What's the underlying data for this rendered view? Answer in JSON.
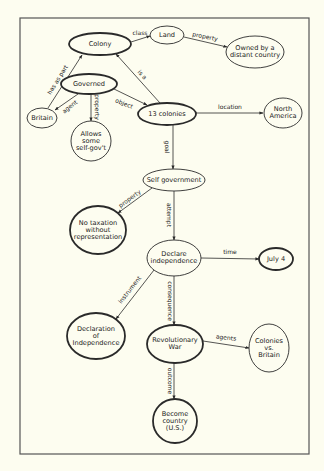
{
  "diagram": {
    "type": "concept-map",
    "frame": {
      "x": 20,
      "y": 18,
      "width": 289,
      "height": 436
    },
    "colors": {
      "background": "#fdfdf0",
      "ink": "#2a2a2a",
      "frame": "#555555"
    },
    "nodes": [
      {
        "id": "colony",
        "lines": [
          "Colony"
        ],
        "cx": 100,
        "cy": 44,
        "rx": 31,
        "ry": 11,
        "bold": true
      },
      {
        "id": "land",
        "lines": [
          "Land"
        ],
        "cx": 167,
        "cy": 35,
        "rx": 17,
        "ry": 9,
        "bold": false
      },
      {
        "id": "owned",
        "lines": [
          "Owned by a",
          "distant country"
        ],
        "cx": 255,
        "cy": 52,
        "rx": 29,
        "ry": 16,
        "bold": false
      },
      {
        "id": "governed",
        "lines": [
          "Governed"
        ],
        "cx": 89,
        "cy": 84,
        "rx": 28,
        "ry": 10,
        "bold": true
      },
      {
        "id": "britain",
        "lines": [
          "Britain"
        ],
        "cx": 42,
        "cy": 118,
        "rx": 15,
        "ry": 10,
        "bold": false
      },
      {
        "id": "allows",
        "lines": [
          "Allows",
          "some",
          "self-gov't"
        ],
        "cx": 91,
        "cy": 141,
        "rx": 20,
        "ry": 20,
        "bold": false
      },
      {
        "id": "thirteen",
        "lines": [
          "13 colonies"
        ],
        "cx": 167,
        "cy": 114,
        "rx": 29,
        "ry": 11,
        "bold": true
      },
      {
        "id": "northamerica",
        "lines": [
          "North",
          "America"
        ],
        "cx": 283,
        "cy": 113,
        "rx": 19,
        "ry": 15,
        "bold": false
      },
      {
        "id": "selfgov",
        "lines": [
          "Self government"
        ],
        "cx": 174,
        "cy": 180,
        "rx": 31,
        "ry": 11,
        "bold": false
      },
      {
        "id": "notax",
        "lines": [
          "No taxation",
          "without",
          "representation"
        ],
        "cx": 98,
        "cy": 230,
        "rx": 28,
        "ry": 24,
        "bold": true
      },
      {
        "id": "declare",
        "lines": [
          "Declare",
          "independence"
        ],
        "cx": 174,
        "cy": 258,
        "rx": 27,
        "ry": 18,
        "bold": false
      },
      {
        "id": "july4",
        "lines": [
          "July 4"
        ],
        "cx": 276,
        "cy": 259,
        "rx": 17,
        "ry": 11,
        "bold": true
      },
      {
        "id": "declaration",
        "lines": [
          "Declaration",
          "of",
          "Independence"
        ],
        "cx": 96,
        "cy": 336,
        "rx": 29,
        "ry": 23,
        "bold": true
      },
      {
        "id": "revwar",
        "lines": [
          "Revolutionary",
          "War"
        ],
        "cx": 175,
        "cy": 344,
        "rx": 28,
        "ry": 19,
        "bold": true
      },
      {
        "id": "colvsbrit",
        "lines": [
          "Colonies",
          "vs.",
          "Britain"
        ],
        "cx": 269,
        "cy": 348,
        "rx": 20,
        "ry": 24,
        "bold": false
      },
      {
        "id": "become",
        "lines": [
          "Become",
          "country",
          "(U.S.)"
        ],
        "cx": 175,
        "cy": 421,
        "rx": 22,
        "ry": 22,
        "bold": true
      }
    ],
    "edges": [
      {
        "from": "colony",
        "to": "land",
        "label": "class",
        "x1": 131,
        "y1": 42,
        "x2": 150,
        "y2": 36,
        "lx": 140,
        "ly": 33,
        "rot": 0
      },
      {
        "from": "land",
        "to": "owned",
        "label": "property",
        "x1": 184,
        "y1": 37,
        "x2": 227,
        "y2": 47,
        "lx": 205,
        "ly": 37,
        "rot": 12
      },
      {
        "from": "britain",
        "to": "colony",
        "label": "has as part",
        "x1": 48,
        "y1": 108,
        "x2": 82,
        "y2": 55,
        "lx": 58,
        "ly": 80,
        "rot": -58
      },
      {
        "from": "governed",
        "to": "britain",
        "label": "agent",
        "x1": 78,
        "y1": 94,
        "x2": 55,
        "y2": 110,
        "lx": 70,
        "ly": 107,
        "rot": -38
      },
      {
        "from": "governed",
        "to": "allows",
        "label": "property",
        "x1": 91,
        "y1": 94,
        "x2": 91,
        "y2": 121,
        "lx": 97,
        "ly": 107,
        "rot": 90
      },
      {
        "from": "governed",
        "to": "thirteen",
        "label": "object",
        "x1": 114,
        "y1": 89,
        "x2": 147,
        "y2": 105,
        "lx": 124,
        "ly": 104,
        "rot": 22
      },
      {
        "from": "thirteen",
        "to": "colony",
        "label": "is a",
        "x1": 160,
        "y1": 103,
        "x2": 116,
        "y2": 54,
        "lx": 142,
        "ly": 75,
        "rot": 48
      },
      {
        "from": "thirteen",
        "to": "northamerica",
        "label": "location",
        "x1": 196,
        "y1": 113,
        "x2": 263,
        "y2": 113,
        "lx": 230,
        "ly": 107,
        "rot": 0
      },
      {
        "from": "thirteen",
        "to": "selfgov",
        "label": "goal",
        "x1": 173,
        "y1": 125,
        "x2": 173,
        "y2": 169,
        "lx": 167,
        "ly": 147,
        "rot": 90
      },
      {
        "from": "selfgov",
        "to": "notax",
        "label": "property",
        "x1": 152,
        "y1": 188,
        "x2": 118,
        "y2": 213,
        "lx": 130,
        "ly": 199,
        "rot": -36
      },
      {
        "from": "selfgov",
        "to": "declare",
        "label": "attempt",
        "x1": 174,
        "y1": 191,
        "x2": 174,
        "y2": 240,
        "lx": 169,
        "ly": 215,
        "rot": 90
      },
      {
        "from": "declare",
        "to": "july4",
        "label": "time",
        "x1": 201,
        "y1": 258,
        "x2": 259,
        "y2": 259,
        "lx": 230,
        "ly": 252,
        "rot": 0
      },
      {
        "from": "declare",
        "to": "declaration",
        "label": "instrument",
        "x1": 154,
        "y1": 270,
        "x2": 116,
        "y2": 319,
        "lx": 130,
        "ly": 290,
        "rot": -52
      },
      {
        "from": "declare",
        "to": "revwar",
        "label": "consequence",
        "x1": 174,
        "y1": 276,
        "x2": 174,
        "y2": 325,
        "lx": 170,
        "ly": 301,
        "rot": 90
      },
      {
        "from": "revwar",
        "to": "colvsbrit",
        "label": "agents",
        "x1": 203,
        "y1": 341,
        "x2": 249,
        "y2": 348,
        "lx": 226,
        "ly": 338,
        "rot": 6
      },
      {
        "from": "revwar",
        "to": "become",
        "label": "outcome",
        "x1": 174,
        "y1": 363,
        "x2": 174,
        "y2": 399,
        "lx": 170,
        "ly": 381,
        "rot": 90
      }
    ]
  }
}
